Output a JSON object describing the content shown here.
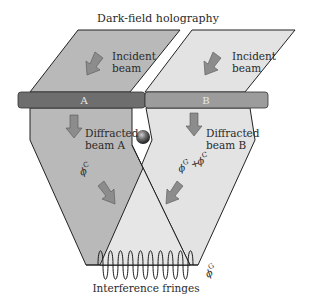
{
  "title": "Dark-field holography",
  "regions": {
    "A": {
      "label": "A",
      "incident_label_1": "Incident",
      "incident_label_2": "beam",
      "diffracted_label_1": "Diffracted",
      "diffracted_label_2": "beam A",
      "phase": "ϕ",
      "phase_sup": "C"
    },
    "B": {
      "label": "B",
      "incident_label_1": "Incident",
      "incident_label_2": "beam",
      "diffracted_label_1": "Diffracted",
      "diffracted_label_2": "beam B",
      "phase_a": "ϕ",
      "phase_a_sup": "G",
      "plus": "+",
      "phase_b": "ϕ",
      "phase_b_sup": "C"
    }
  },
  "fringes_label": "Interference fringes",
  "gradient_phase": "ϕ",
  "gradient_phase_sup": "G",
  "colors": {
    "region_a": "#b9b9b9",
    "region_b": "#e3e3e3",
    "bar_a": "#6e6e6e",
    "bar_b": "#9c9c9c",
    "arrow": "#8c8c8c",
    "outline": "#222222"
  }
}
